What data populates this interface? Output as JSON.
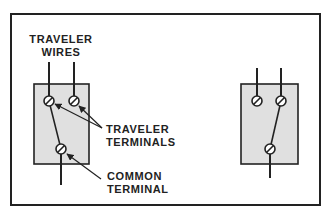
{
  "diagram": {
    "labels": {
      "traveler_wires": [
        "TRAVELER",
        "WIRES"
      ],
      "traveler_terminals": [
        "TRAVELER",
        "TERMINALS"
      ],
      "common_terminal": [
        "COMMON",
        "TERMINAL"
      ]
    },
    "switches": [
      {
        "id": "left-switch",
        "position": "left",
        "box": {
          "x": 34,
          "y": 84,
          "w": 55,
          "h": 80
        },
        "traveler_terminals": [
          {
            "x": 49,
            "y": 101
          },
          {
            "x": 74,
            "y": 101
          }
        ],
        "common_terminal": {
          "x": 61,
          "y": 149
        },
        "lever_connects": "left traveler terminal to common terminal"
      },
      {
        "id": "right-switch",
        "position": "right",
        "box": {
          "x": 241,
          "y": 84,
          "w": 57,
          "h": 80
        },
        "traveler_terminals": [
          {
            "x": 257,
            "y": 101
          },
          {
            "x": 281,
            "y": 101
          }
        ],
        "common_terminal": {
          "x": 270,
          "y": 149
        },
        "lever_connects": "right traveler terminal to common terminal"
      }
    ],
    "colors": {
      "stroke": "#222222",
      "box_fill": "#e0e0e0",
      "background": "#ffffff"
    }
  }
}
